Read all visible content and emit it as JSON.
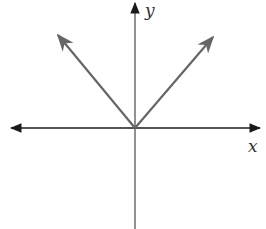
{
  "diagram": {
    "type": "graph",
    "axes": {
      "x_label": "x",
      "y_label": "y"
    },
    "colors": {
      "axis": "#1a1a1a",
      "curve": "#666666"
    }
  }
}
